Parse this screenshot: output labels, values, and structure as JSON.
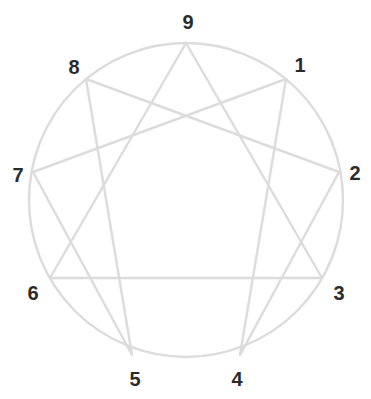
{
  "figure": {
    "name": "enneagram-diagram",
    "width": 371,
    "height": 399,
    "background_color": "#ffffff",
    "line_color": "#dcdcdc",
    "line_width": 2.4,
    "label_color": "#2b2b2b",
    "label_font_size": 20
  },
  "chart_data": {
    "type": "diagram",
    "title": "",
    "subtitle": "",
    "xlabel": "",
    "ylabel": "",
    "grid": false,
    "legend": "none",
    "shape": "enneagram",
    "circle": {
      "cx": 186,
      "cy": 200,
      "r": 157
    },
    "points": [
      {
        "label": "1",
        "angle_deg": 40,
        "px": 286,
        "py": 79,
        "label_px": 300,
        "label_py": 65
      },
      {
        "label": "2",
        "angle_deg": 80,
        "px": 339,
        "py": 172,
        "label_px": 355,
        "label_py": 173
      },
      {
        "label": "3",
        "angle_deg": 120,
        "px": 322,
        "py": 278,
        "label_px": 339,
        "label_py": 293
      },
      {
        "label": "4",
        "angle_deg": 160,
        "px": 240,
        "py": 355,
        "label_px": 237,
        "label_py": 379
      },
      {
        "label": "5",
        "angle_deg": 200,
        "px": 132,
        "py": 355,
        "label_px": 135,
        "label_py": 379
      },
      {
        "label": "6",
        "angle_deg": 240,
        "px": 50,
        "py": 278,
        "label_px": 33,
        "label_py": 293
      },
      {
        "label": "7",
        "angle_deg": 280,
        "px": 33,
        "py": 172,
        "label_px": 18,
        "label_py": 175
      },
      {
        "label": "8",
        "angle_deg": 320,
        "px": 86,
        "py": 79,
        "label_px": 74,
        "label_py": 67
      },
      {
        "label": "9",
        "angle_deg": 0,
        "px": 186,
        "py": 43,
        "label_px": 188,
        "label_py": 22
      }
    ],
    "triangle_path": [
      "9",
      "3",
      "6",
      "9"
    ],
    "hexad_path": [
      "1",
      "4",
      "2",
      "8",
      "5",
      "7",
      "1"
    ],
    "annotations": []
  }
}
